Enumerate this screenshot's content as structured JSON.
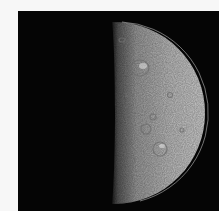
{
  "image": {
    "subject": "half-illuminated cratered moon",
    "background_color": "#050505",
    "page_color": "#f7f7f7",
    "moon": {
      "lit_color": "#c9c9c9",
      "shadow_color": "#050505"
    }
  }
}
